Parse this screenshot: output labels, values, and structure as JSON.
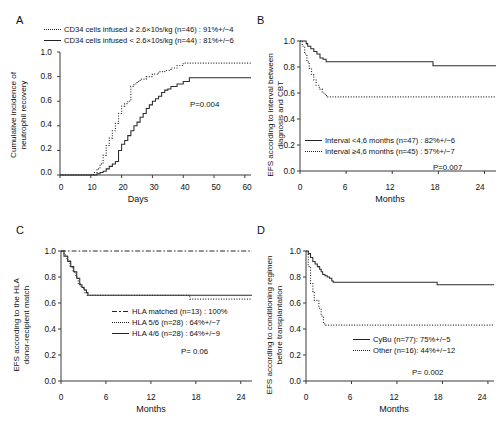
{
  "figure": {
    "type": "kaplan-meier-multipanel",
    "panels": [
      "A",
      "B",
      "C",
      "D"
    ]
  },
  "panelA": {
    "letter": "A",
    "ylabel_line1": "Cumulative incidence of",
    "ylabel_line2": "neutrophil recovery",
    "xlabel": "Days",
    "yticks": [
      "1.0",
      "0.8",
      "0.6",
      "0.4",
      "0.2",
      "0.0"
    ],
    "xticks": [
      "0",
      "10",
      "20",
      "30",
      "40",
      "50",
      "60"
    ],
    "pvalue": "P=0.004",
    "legend": [
      {
        "style": "dotted",
        "text_pre": "CD34 cells infused ≥ 2.6×10",
        "sup": "5",
        "text_post": "/kg (n=46) : 91%+/−4"
      },
      {
        "style": "solid",
        "text_pre": "CD34 cells infused < 2.6×10",
        "sup": "5",
        "text_post": "/kg (n=44) : 81%+/−6"
      }
    ],
    "chart_data": {
      "type": "line",
      "title": "Cumulative incidence of neutrophil recovery",
      "xlabel": "Days",
      "ylabel": "Cumulative incidence of neutrophil recovery",
      "xlim": [
        0,
        62
      ],
      "ylim": [
        0,
        1.0
      ],
      "grid": false,
      "legend_position": "top",
      "series": [
        {
          "name": "CD34 cells infused ≥ 2.6×10^5/kg (n=46)",
          "style": "dotted",
          "plateau": 0.91,
          "n": 46,
          "estimate_pct": 91,
          "se_pct": 4,
          "x": [
            0,
            10,
            11,
            12,
            13,
            14,
            15,
            16,
            17,
            18,
            19,
            20,
            21,
            22,
            23,
            24,
            25,
            26,
            28,
            30,
            32,
            34,
            36,
            38,
            40,
            62
          ],
          "y": [
            0,
            0,
            0.02,
            0.05,
            0.09,
            0.16,
            0.24,
            0.3,
            0.36,
            0.42,
            0.5,
            0.56,
            0.58,
            0.6,
            0.72,
            0.74,
            0.76,
            0.78,
            0.8,
            0.82,
            0.84,
            0.85,
            0.87,
            0.89,
            0.91,
            0.91
          ]
        },
        {
          "name": "CD34 cells infused < 2.6×10^5/kg (n=44)",
          "style": "solid",
          "plateau": 0.79,
          "n": 44,
          "estimate_pct": 81,
          "se_pct": 6,
          "x": [
            0,
            10,
            12,
            13,
            14,
            15,
            16,
            17,
            18,
            19,
            20,
            21,
            22,
            23,
            24,
            25,
            26,
            27,
            28,
            29,
            30,
            31,
            32,
            33,
            34,
            35,
            36,
            38,
            40,
            42,
            62
          ],
          "y": [
            0,
            0,
            0.01,
            0.02,
            0.03,
            0.05,
            0.07,
            0.09,
            0.11,
            0.2,
            0.25,
            0.28,
            0.32,
            0.36,
            0.4,
            0.43,
            0.47,
            0.5,
            0.54,
            0.57,
            0.6,
            0.62,
            0.64,
            0.67,
            0.69,
            0.7,
            0.72,
            0.74,
            0.76,
            0.79,
            0.79
          ]
        }
      ]
    }
  },
  "panelB": {
    "letter": "B",
    "ylabel_line1": "EFS according to interval between",
    "ylabel_line2": "diagnosis and CBT",
    "xlabel": "Months",
    "yticks": [
      "1.0",
      "0.8",
      "0.6",
      "0.4",
      "0.2",
      "0.0"
    ],
    "xticks": [
      "0",
      "6",
      "12",
      "18",
      "24"
    ],
    "pvalue": "P=0.007",
    "legend": [
      {
        "style": "solid",
        "text": "Interval <4,6 months (n=47) : 82%+/−6"
      },
      {
        "style": "dotted",
        "text": "Interval ≥4,6 months (n=45) : 57%+/−7"
      }
    ],
    "chart_data": {
      "type": "line",
      "title": "EFS according to interval between diagnosis and CBT",
      "xlabel": "Months",
      "ylabel": "EFS according to interval between diagnosis and CBT",
      "xlim": [
        0,
        25.5
      ],
      "ylim": [
        0,
        1.0
      ],
      "grid": false,
      "legend_position": "bottom-left",
      "series": [
        {
          "name": "Interval <4,6 months (n=47)",
          "style": "solid",
          "n": 47,
          "estimate_pct": 82,
          "se_pct": 6,
          "x": [
            0,
            0.5,
            0.8,
            1.0,
            1.4,
            1.8,
            2.2,
            2.6,
            3.0,
            3.4,
            17.3,
            25.5
          ],
          "y": [
            1.0,
            1.0,
            0.98,
            0.96,
            0.94,
            0.92,
            0.9,
            0.87,
            0.86,
            0.84,
            0.81,
            0.81
          ]
        },
        {
          "name": "Interval ≥4,6 months (n=45)",
          "style": "dotted",
          "n": 45,
          "estimate_pct": 57,
          "se_pct": 7,
          "x": [
            0,
            0.3,
            0.6,
            0.9,
            1.2,
            1.5,
            1.8,
            2.1,
            2.5,
            2.9,
            3.3,
            3.6,
            25.5
          ],
          "y": [
            1.0,
            0.96,
            0.9,
            0.84,
            0.79,
            0.74,
            0.7,
            0.66,
            0.63,
            0.6,
            0.58,
            0.57,
            0.57
          ]
        }
      ]
    }
  },
  "panelC": {
    "letter": "C",
    "ylabel_line1": "EFS according to the HLA",
    "ylabel_line2": "donor-recipient match",
    "xlabel": "Months",
    "yticks": [
      "1.0",
      "0.8",
      "0.6",
      "0.4",
      "0.2",
      "0.0"
    ],
    "xticks": [
      "0",
      "6",
      "12",
      "18",
      "24"
    ],
    "pvalue": "P= 0.06",
    "legend": [
      {
        "style": "dashdot",
        "text": "HLA matched (n=13) : 100%"
      },
      {
        "style": "dotted",
        "text": "HLA 5/6 (n=28) : 64%+/−7"
      },
      {
        "style": "solid",
        "text": "HLA 4/6 (n=28) : 64%+/−9"
      }
    ],
    "chart_data": {
      "type": "line",
      "title": "EFS according to the HLA donor-recipient match",
      "xlabel": "Months",
      "ylabel": "EFS according to the HLA donor-recipient match",
      "xlim": [
        0,
        25.5
      ],
      "ylim": [
        0,
        1.0
      ],
      "grid": false,
      "legend_position": "middle-right",
      "series": [
        {
          "name": "HLA matched (n=13)",
          "style": "dashdot",
          "n": 13,
          "estimate_pct": 100,
          "se_pct": null,
          "x": [
            0,
            0.6,
            25.5
          ],
          "y": [
            1.0,
            1.0,
            1.0
          ]
        },
        {
          "name": "HLA 5/6 (n=28)",
          "style": "dotted",
          "n": 28,
          "estimate_pct": 64,
          "se_pct": 7,
          "x": [
            0,
            0.4,
            0.8,
            1.2,
            1.6,
            2.0,
            2.3,
            2.6,
            2.9,
            3.2,
            3.5,
            17.2,
            25.5
          ],
          "y": [
            1.0,
            0.97,
            0.93,
            0.88,
            0.84,
            0.8,
            0.75,
            0.73,
            0.71,
            0.68,
            0.66,
            0.63,
            0.63
          ]
        },
        {
          "name": "HLA 4/6 (n=28)",
          "style": "solid",
          "n": 28,
          "estimate_pct": 64,
          "se_pct": 9,
          "x": [
            0,
            0.4,
            0.9,
            1.3,
            1.7,
            2.1,
            2.5,
            2.8,
            3.1,
            3.4,
            3.6,
            25.5
          ],
          "y": [
            1.0,
            0.96,
            0.92,
            0.88,
            0.84,
            0.79,
            0.74,
            0.72,
            0.7,
            0.68,
            0.66,
            0.66
          ]
        }
      ]
    }
  },
  "panelD": {
    "letter": "D",
    "ylabel_line1": "EFS according to conditioning regimen",
    "ylabel_line2": "before transplantation",
    "xlabel": "Months",
    "yticks": [
      "1.0",
      "0.8",
      "0.6",
      "0.4",
      "0.2",
      "0.0"
    ],
    "xticks": [
      "0",
      "6",
      "12",
      "18",
      "24"
    ],
    "pvalue": "P= 0.002",
    "legend": [
      {
        "style": "solid",
        "text": "CyBu (n=77): 75%+/−5"
      },
      {
        "style": "dotted",
        "text": "Other (n=16): 44%+/−12"
      }
    ],
    "chart_data": {
      "type": "line",
      "title": "EFS according to conditioning regimen before transplantation",
      "xlabel": "Months",
      "ylabel": "EFS according to conditioning regimen before transplantation",
      "xlim": [
        0,
        24.8
      ],
      "ylim": [
        0,
        1.0
      ],
      "grid": false,
      "legend_position": "bottom-right",
      "series": [
        {
          "name": "CyBu (n=77)",
          "style": "solid",
          "n": 77,
          "estimate_pct": 75,
          "se_pct": 5,
          "x": [
            0,
            0.3,
            0.6,
            0.9,
            1.2,
            1.5,
            1.8,
            2.0,
            2.2,
            2.5,
            2.8,
            3.1,
            3.4,
            3.6,
            17.3,
            24.8
          ],
          "y": [
            1.0,
            0.98,
            0.95,
            0.92,
            0.9,
            0.88,
            0.86,
            0.84,
            0.82,
            0.81,
            0.8,
            0.79,
            0.77,
            0.76,
            0.74,
            0.74
          ]
        },
        {
          "name": "Other (n=16)",
          "style": "dotted",
          "n": 16,
          "estimate_pct": 44,
          "se_pct": 12,
          "x": [
            0,
            0.3,
            0.6,
            0.9,
            1.1,
            1.4,
            1.7,
            2.0,
            2.3,
            2.6,
            24.8
          ],
          "y": [
            1.0,
            0.88,
            0.75,
            0.69,
            0.62,
            0.62,
            0.56,
            0.5,
            0.44,
            0.43,
            0.43
          ]
        }
      ]
    }
  }
}
